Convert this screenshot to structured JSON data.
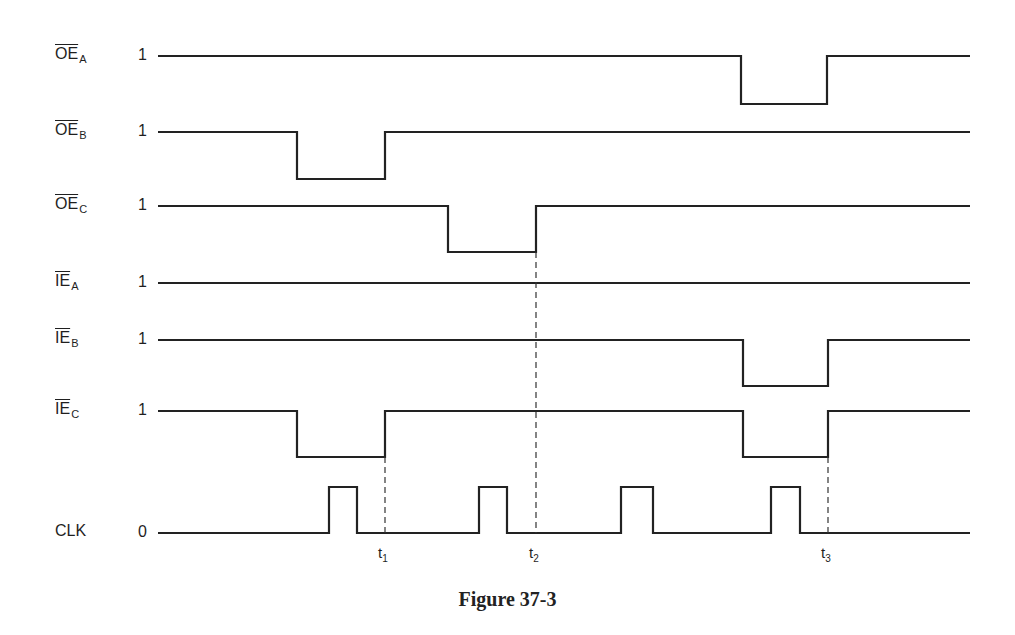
{
  "figure": {
    "caption": "Figure 37-3",
    "x_start": 158,
    "x_end": 970
  },
  "signals": [
    {
      "id": "oe_a",
      "name": "OE",
      "sub": "A",
      "bar": "full",
      "level_label": "1",
      "high_y": 56,
      "low_y": 104,
      "initial": "high",
      "transitions": [
        741,
        827
      ]
    },
    {
      "id": "oe_b",
      "name": "OE",
      "sub": "B",
      "bar": "full",
      "level_label": "1",
      "high_y": 132,
      "low_y": 179,
      "initial": "high",
      "transitions": [
        297,
        385
      ]
    },
    {
      "id": "oe_c",
      "name": "OE",
      "sub": "C",
      "bar": "full",
      "level_label": "1",
      "high_y": 206,
      "low_y": 252,
      "initial": "high",
      "transitions": [
        448,
        536
      ]
    },
    {
      "id": "ie_a",
      "name": "IE",
      "sub": "A",
      "bar": "full",
      "level_label": "1",
      "high_y": 283,
      "low_y": 330,
      "initial": "high",
      "transitions": []
    },
    {
      "id": "ie_b",
      "name": "IE",
      "sub": "B",
      "bar": "full",
      "level_label": "1",
      "high_y": 340,
      "low_y": 386,
      "initial": "high",
      "transitions": [
        743,
        828
      ]
    },
    {
      "id": "ie_c",
      "name": "IE",
      "sub": "C",
      "bar": "full",
      "level_label": "1",
      "high_y": 411,
      "low_y": 457,
      "initial": "high",
      "transitions": [
        297,
        385,
        743,
        828
      ]
    },
    {
      "id": "clk",
      "name": "CLK",
      "sub": "",
      "bar": "none",
      "level_label": "0",
      "high_y": 487,
      "low_y": 533,
      "initial": "low",
      "transitions": [
        329,
        357,
        479,
        507,
        621,
        653,
        771,
        800
      ]
    }
  ],
  "time_markers": [
    {
      "label": "t",
      "sub": "1",
      "x": 385,
      "y_top": 457
    },
    {
      "label": "t",
      "sub": "2",
      "x": 536,
      "y_top": 252
    },
    {
      "label": "t",
      "sub": "3",
      "x": 828,
      "y_top": 457
    }
  ],
  "colors": {
    "trace": "#222222",
    "background": "#ffffff"
  }
}
